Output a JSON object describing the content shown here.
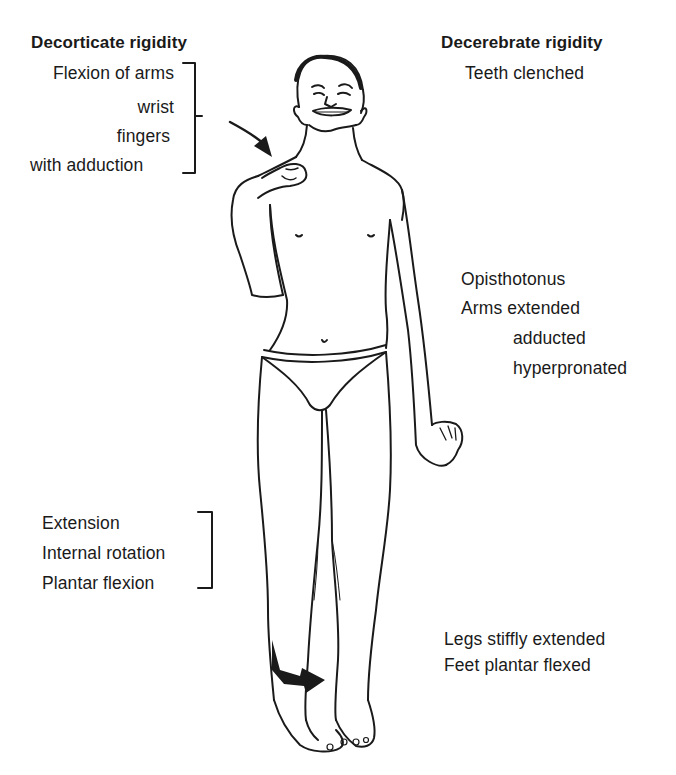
{
  "diagram": {
    "left_heading": "Decorticate rigidity",
    "right_heading": "Decerebrate rigidity",
    "decorticate_arms": [
      "Flexion of arms",
      "wrist",
      "fingers",
      "with adduction"
    ],
    "decorticate_legs": [
      "Extension",
      "Internal rotation",
      "Plantar flexion"
    ],
    "decerebrate_head": "Teeth clenched",
    "decerebrate_trunk_arms": [
      "Opisthotonus",
      "Arms extended",
      "adducted",
      "hyperpronated"
    ],
    "decerebrate_legs": [
      "Legs stiffly extended",
      "Feet plantar flexed"
    ],
    "figure": "standing-human-figure-posturing",
    "arrows": [
      "arrow-to-flexed-arm",
      "arrow-to-internally-rotated-foot"
    ],
    "colors": {
      "ink": "#1a1a1a",
      "background": "#ffffff"
    }
  }
}
